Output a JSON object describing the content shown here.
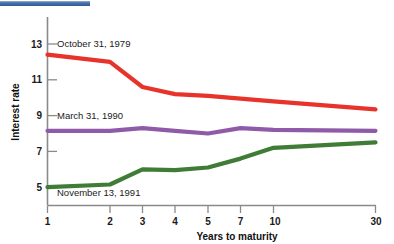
{
  "figure": {
    "background_color": "#ffffff",
    "top_rule_color": "#2e5b96"
  },
  "chart_data": {
    "type": "line",
    "title": "",
    "xlabel": "Years to maturity",
    "ylabel": "Interest rate",
    "categories": [
      "1",
      "2",
      "3",
      "4",
      "5",
      "7",
      "10",
      "30"
    ],
    "x_tick_labels": [
      "1",
      "2",
      "3",
      "4",
      "5",
      "7",
      "10",
      "30"
    ],
    "y_tick_labels": [
      "13",
      "11",
      "9",
      "7",
      "5"
    ],
    "y_ticks": [
      13,
      11,
      9,
      7,
      5
    ],
    "ylim": [
      4.2,
      13.6
    ],
    "grid": false,
    "legend_position": "inline-annotations",
    "series": [
      {
        "name": "October 31, 1979",
        "color": "#e8332b",
        "values": [
          12.4,
          12.0,
          10.6,
          10.2,
          10.1,
          9.95,
          9.8,
          9.35
        ]
      },
      {
        "name": "March 31, 1990",
        "color": "#8f5ba8",
        "values": [
          8.15,
          8.15,
          8.3,
          8.15,
          8.0,
          8.3,
          8.2,
          8.15
        ]
      },
      {
        "name": "November 13, 1991",
        "color": "#3f7c35",
        "values": [
          5.0,
          5.15,
          6.0,
          5.95,
          6.1,
          6.6,
          7.2,
          7.5
        ]
      }
    ],
    "annotations": [
      {
        "text": "October 31, 1979",
        "series": "October 31, 1979"
      },
      {
        "text": "March 31, 1990",
        "series": "March 31, 1990"
      },
      {
        "text": "November 13, 1991",
        "series": "November 13, 1991"
      }
    ]
  }
}
